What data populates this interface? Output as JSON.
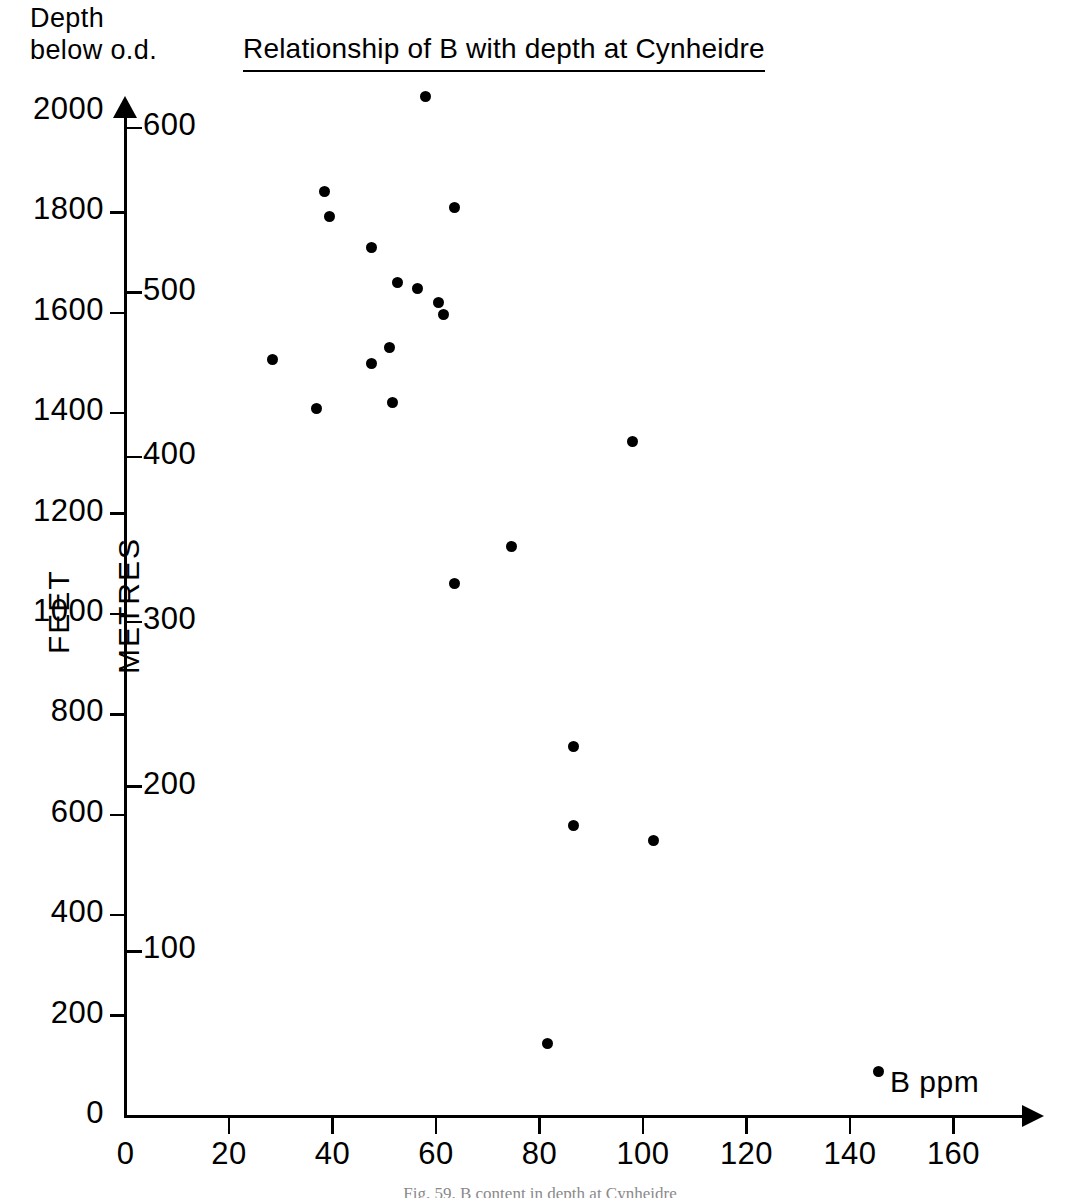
{
  "header": {
    "depth_caption": "Depth\nbelow o.d.",
    "title": "Relationship of B with depth at Cynheidre"
  },
  "figure_caption": "Fig. 59.   B content in depth at Cynheidre",
  "axes": {
    "y_left_name": "FEET",
    "y_right_name": "METRES",
    "x_name": "B  ppm",
    "feet_ticks": [
      "0",
      "200",
      "400",
      "600",
      "800",
      "1000",
      "1200",
      "1400",
      "1600",
      "1800",
      "2000"
    ],
    "metres_ticks": [
      "100",
      "200",
      "300",
      "400",
      "500",
      "600"
    ],
    "x_ticks": [
      "0",
      "20",
      "40",
      "60",
      "80",
      "100",
      "120",
      "140",
      "160"
    ]
  },
  "chart_data": {
    "type": "scatter",
    "title": "Relationship of B with depth at Cynheidre",
    "xlabel": "B  ppm",
    "ylabel": "Depth below o.d. (FEET)",
    "ylabel_secondary": "Depth below o.d. (METRES)",
    "xlim": [
      0,
      175
    ],
    "ylim": [
      0,
      2000
    ],
    "ylim_secondary": [
      0,
      610
    ],
    "grid": false,
    "legend": null,
    "marker": "filled-circle",
    "marker_color": "#000000",
    "x": [
      58,
      38.5,
      39.5,
      63.5,
      47.5,
      52.5,
      56.5,
      60.5,
      61.5,
      28.5,
      47.5,
      51,
      37,
      51.5,
      74.5,
      98,
      63.5,
      86.5,
      86.5,
      102,
      81.5,
      145.5
    ],
    "y": [
      2031,
      1841,
      1791,
      1809,
      1730,
      1660,
      1648,
      1620,
      1596,
      1506,
      1500,
      1530,
      1410,
      1422,
      1135,
      1344,
      1060,
      737,
      578,
      548,
      145,
      88
    ],
    "points": [
      {
        "x": 58,
        "y_feet": 2031,
        "y_metres": 619
      },
      {
        "x": 38.5,
        "y_feet": 1841,
        "y_metres": 561
      },
      {
        "x": 39.5,
        "y_feet": 1791,
        "y_metres": 546
      },
      {
        "x": 63.5,
        "y_feet": 1809,
        "y_metres": 551
      },
      {
        "x": 47.5,
        "y_feet": 1730,
        "y_metres": 527
      },
      {
        "x": 52.5,
        "y_feet": 1660,
        "y_metres": 506
      },
      {
        "x": 56.5,
        "y_feet": 1648,
        "y_metres": 502
      },
      {
        "x": 60.5,
        "y_feet": 1620,
        "y_metres": 494
      },
      {
        "x": 61.5,
        "y_feet": 1596,
        "y_metres": 486
      },
      {
        "x": 28.5,
        "y_feet": 1506,
        "y_metres": 459
      },
      {
        "x": 47.5,
        "y_feet": 1500,
        "y_metres": 457
      },
      {
        "x": 51,
        "y_feet": 1530,
        "y_metres": 466
      },
      {
        "x": 37,
        "y_feet": 1410,
        "y_metres": 430
      },
      {
        "x": 51.5,
        "y_feet": 1422,
        "y_metres": 433
      },
      {
        "x": 74.5,
        "y_feet": 1135,
        "y_metres": 346
      },
      {
        "x": 98,
        "y_feet": 1344,
        "y_metres": 410
      },
      {
        "x": 63.5,
        "y_feet": 1060,
        "y_metres": 323
      },
      {
        "x": 86.5,
        "y_feet": 737,
        "y_metres": 225
      },
      {
        "x": 86.5,
        "y_feet": 578,
        "y_metres": 176
      },
      {
        "x": 102,
        "y_feet": 548,
        "y_metres": 167
      },
      {
        "x": 81.5,
        "y_feet": 145,
        "y_metres": 44
      },
      {
        "x": 145.5,
        "y_feet": 88,
        "y_metres": 27
      }
    ]
  }
}
